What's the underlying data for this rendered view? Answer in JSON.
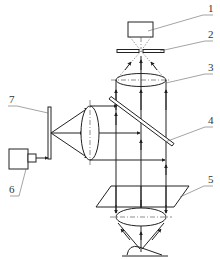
{
  "diagram": {
    "type": "optical schematic",
    "components": [
      {
        "id": "1",
        "label": "1",
        "role": "detector box (top)"
      },
      {
        "id": "2",
        "label": "2",
        "role": "pinhole plate (detector side)"
      },
      {
        "id": "3",
        "label": "3",
        "role": "upper lens (focusing to detector)"
      },
      {
        "id": "4",
        "label": "4",
        "role": "beam splitter (inclined plate)"
      },
      {
        "id": "5",
        "label": "5",
        "role": "inclined plane / scanning plate"
      },
      {
        "id": "6",
        "label": "6",
        "role": "light source box (left)"
      },
      {
        "id": "7",
        "label": "7",
        "role": "pinhole plate (source side)"
      }
    ],
    "colors": {
      "line": "#222222",
      "leader": "#666666",
      "background": "#ffffff"
    }
  }
}
